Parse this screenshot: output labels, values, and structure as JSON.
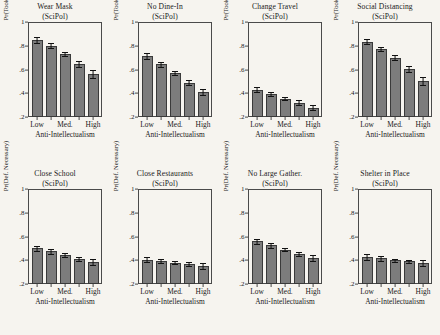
{
  "figure": {
    "background_color": "#f6f4ef",
    "bar_color": "#7c7c7c",
    "bar_edge_color": "#3a3a3a",
    "error_bar_color": "#111111",
    "axis_color": "#4a4a4a"
  },
  "chart_data": [
    {
      "type": "bar",
      "title": "Wear Mask",
      "subtitle": "(SciPol)",
      "xlabel": "Anti-Intellectualism",
      "ylabel": "Pr(Took Action)",
      "categories": [
        "Low",
        "",
        "Med.",
        "",
        "High"
      ],
      "tick_labels": [
        "Low",
        "Med.",
        "High"
      ],
      "values": [
        0.85,
        0.8,
        0.73,
        0.65,
        0.56
      ],
      "err_low": [
        0.825,
        0.78,
        0.71,
        0.625,
        0.525
      ],
      "err_high": [
        0.875,
        0.82,
        0.75,
        0.675,
        0.595
      ],
      "ylim": [
        0.2,
        1.0
      ],
      "yticks": [
        0.2,
        0.4,
        0.6,
        0.8,
        1.0
      ],
      "ytick_labels": [
        ".2",
        ".4",
        ".6",
        ".8",
        "1"
      ],
      "grid": false,
      "legend": "none"
    },
    {
      "type": "bar",
      "title": "No Dine-In",
      "subtitle": "(SciPol)",
      "xlabel": "Anti-Intellectualism",
      "ylabel": "Pr(Took Action)",
      "categories": [
        "Low",
        "",
        "Med.",
        "",
        "High"
      ],
      "tick_labels": [
        "Low",
        "Med.",
        "High"
      ],
      "values": [
        0.71,
        0.645,
        0.57,
        0.49,
        0.41
      ],
      "err_low": [
        0.685,
        0.625,
        0.553,
        0.468,
        0.383
      ],
      "err_high": [
        0.737,
        0.665,
        0.588,
        0.513,
        0.44
      ],
      "ylim": [
        0.2,
        1.0
      ],
      "yticks": [
        0.2,
        0.4,
        0.6,
        0.8,
        1.0
      ],
      "ytick_labels": [
        ".2",
        ".4",
        ".6",
        ".8",
        "1"
      ],
      "grid": false,
      "legend": "none"
    },
    {
      "type": "bar",
      "title": "Change Travel",
      "subtitle": "(SciPol)",
      "xlabel": "Anti-Intellectualism",
      "ylabel": "Pr(Took Action)",
      "categories": [
        "Low",
        "",
        "Med.",
        "",
        "High"
      ],
      "tick_labels": [
        "Low",
        "Med.",
        "High"
      ],
      "values": [
        0.43,
        0.395,
        0.355,
        0.32,
        0.28
      ],
      "err_low": [
        0.408,
        0.378,
        0.34,
        0.301,
        0.258
      ],
      "err_high": [
        0.452,
        0.412,
        0.371,
        0.34,
        0.303
      ],
      "ylim": [
        0.2,
        1.0
      ],
      "yticks": [
        0.2,
        0.4,
        0.6,
        0.8,
        1.0
      ],
      "ytick_labels": [
        ".2",
        ".4",
        ".6",
        ".8",
        "1"
      ],
      "grid": false,
      "legend": "none"
    },
    {
      "type": "bar",
      "title": "Social Distancing",
      "subtitle": "(SciPol)",
      "xlabel": "Anti-Intellectualism",
      "ylabel": "Pr(Took Action)",
      "categories": [
        "Low",
        "",
        "Med.",
        "",
        "High"
      ],
      "tick_labels": [
        "Low",
        "Med.",
        "High"
      ],
      "values": [
        0.835,
        0.77,
        0.7,
        0.605,
        0.505
      ],
      "err_low": [
        0.812,
        0.752,
        0.681,
        0.581,
        0.472
      ],
      "err_high": [
        0.858,
        0.789,
        0.719,
        0.63,
        0.539
      ],
      "ylim": [
        0.2,
        1.0
      ],
      "yticks": [
        0.2,
        0.4,
        0.6,
        0.8,
        1.0
      ],
      "ytick_labels": [
        ".2",
        ".4",
        ".6",
        ".8",
        "1"
      ],
      "grid": false,
      "legend": "none"
    },
    {
      "type": "bar",
      "title": "Close School",
      "subtitle": "(SciPol)",
      "xlabel": "Anti-Intellectualism",
      "ylabel": "Pr(Def. Necessary)",
      "categories": [
        "Low",
        "",
        "Med.",
        "",
        "High"
      ],
      "tick_labels": [
        "Low",
        "Med.",
        "High"
      ],
      "values": [
        0.5,
        0.475,
        0.445,
        0.41,
        0.385
      ],
      "err_low": [
        0.477,
        0.456,
        0.43,
        0.391,
        0.358
      ],
      "err_high": [
        0.523,
        0.494,
        0.461,
        0.43,
        0.412
      ],
      "ylim": [
        0.2,
        1.0
      ],
      "yticks": [
        0.2,
        0.4,
        0.6,
        0.8,
        1.0
      ],
      "ytick_labels": [
        ".2",
        ".4",
        ".6",
        ".8",
        "1"
      ],
      "grid": false,
      "legend": "none"
    },
    {
      "type": "bar",
      "title": "Close Restaurants",
      "subtitle": "(SciPol)",
      "xlabel": "Anti-Intellectualism",
      "ylabel": "Pr(Def. Necessary)",
      "categories": [
        "Low",
        "",
        "Med.",
        "",
        "High"
      ],
      "tick_labels": [
        "Low",
        "Med.",
        "High"
      ],
      "values": [
        0.405,
        0.395,
        0.38,
        0.365,
        0.35
      ],
      "err_low": [
        0.382,
        0.377,
        0.365,
        0.348,
        0.325
      ],
      "err_high": [
        0.428,
        0.413,
        0.395,
        0.382,
        0.375
      ],
      "ylim": [
        0.2,
        1.0
      ],
      "yticks": [
        0.2,
        0.4,
        0.6,
        0.8,
        1.0
      ],
      "ytick_labels": [
        ".2",
        ".4",
        ".6",
        ".8",
        "1"
      ],
      "grid": false,
      "legend": "none"
    },
    {
      "type": "bar",
      "title": "No Large Gather.",
      "subtitle": "(SciPol)",
      "xlabel": "Anti-Intellectualism",
      "ylabel": "Pr(Def. Necessary)",
      "categories": [
        "Low",
        "",
        "Med.",
        "",
        "High"
      ],
      "tick_labels": [
        "Low",
        "Med.",
        "High"
      ],
      "values": [
        0.56,
        0.525,
        0.49,
        0.455,
        0.42
      ],
      "err_low": [
        0.538,
        0.507,
        0.475,
        0.437,
        0.395
      ],
      "err_high": [
        0.582,
        0.543,
        0.505,
        0.473,
        0.445
      ],
      "ylim": [
        0.2,
        1.0
      ],
      "yticks": [
        0.2,
        0.4,
        0.6,
        0.8,
        1.0
      ],
      "ytick_labels": [
        ".2",
        ".4",
        ".6",
        ".8",
        "1"
      ],
      "grid": false,
      "legend": "none"
    },
    {
      "type": "bar",
      "title": "Shelter in Place",
      "subtitle": "(SciPol)",
      "xlabel": "Anti-Intellectualism",
      "ylabel": "Pr(Def. Necessary)",
      "categories": [
        "Low",
        "",
        "Med.",
        "",
        "High"
      ],
      "tick_labels": [
        "Low",
        "Med.",
        "High"
      ],
      "values": [
        0.425,
        0.415,
        0.4,
        0.39,
        0.375
      ],
      "err_low": [
        0.4,
        0.397,
        0.386,
        0.374,
        0.348
      ],
      "err_high": [
        0.45,
        0.433,
        0.414,
        0.406,
        0.402
      ],
      "ylim": [
        0.2,
        1.0
      ],
      "yticks": [
        0.2,
        0.4,
        0.6,
        0.8,
        1.0
      ],
      "ytick_labels": [
        ".2",
        ".4",
        ".6",
        ".8",
        "1"
      ],
      "grid": false,
      "legend": "none"
    }
  ]
}
